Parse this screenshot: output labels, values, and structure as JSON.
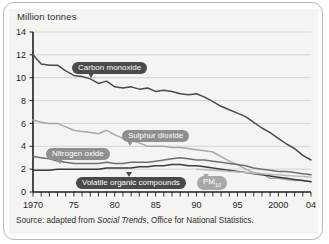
{
  "chart_data": {
    "type": "line",
    "title": "Million tonnes",
    "xlabel": "",
    "ylabel": "Million tonnes",
    "xlim": [
      1970,
      2004
    ],
    "ylim": [
      0,
      14
    ],
    "ytick_labels": [
      "0",
      "2",
      "4",
      "6",
      "8",
      "10",
      "12",
      "14"
    ],
    "ytick_values": [
      0,
      2,
      4,
      6,
      8,
      10,
      12,
      14
    ],
    "xtick_labels": [
      "1970",
      "75",
      "80",
      "85",
      "90",
      "95",
      "2000",
      "04"
    ],
    "xtick_values": [
      1970,
      1975,
      1980,
      1985,
      1990,
      1995,
      2000,
      2004
    ],
    "grid": true,
    "legend_position": "inline-callouts",
    "x": [
      1970,
      1971,
      1972,
      1973,
      1974,
      1975,
      1976,
      1977,
      1978,
      1979,
      1980,
      1981,
      1982,
      1983,
      1984,
      1985,
      1986,
      1987,
      1988,
      1989,
      1990,
      1991,
      1992,
      1993,
      1994,
      1995,
      1996,
      1997,
      1998,
      1999,
      2000,
      2001,
      2002,
      2003,
      2004
    ],
    "series": [
      {
        "name": "Carbon monoxide",
        "color": "#4a4a4a",
        "values": [
          12.0,
          11.2,
          11.1,
          11.1,
          10.6,
          10.2,
          10.1,
          9.9,
          9.5,
          9.7,
          9.2,
          9.1,
          9.2,
          9.0,
          9.1,
          8.8,
          8.9,
          8.8,
          8.6,
          8.5,
          8.6,
          8.3,
          7.9,
          7.5,
          7.2,
          6.9,
          6.6,
          6.1,
          5.6,
          5.2,
          4.7,
          4.2,
          3.8,
          3.2,
          2.8
        ]
      },
      {
        "name": "Sulphur dioxide",
        "color": "#a8a8a8",
        "values": [
          6.3,
          6.1,
          6.0,
          6.0,
          5.7,
          5.4,
          5.3,
          5.2,
          5.1,
          5.4,
          5.0,
          4.7,
          4.5,
          4.3,
          4.0,
          4.0,
          4.0,
          3.9,
          3.9,
          3.8,
          3.7,
          3.6,
          3.5,
          3.1,
          2.7,
          2.4,
          2.0,
          1.7,
          1.6,
          1.2,
          1.2,
          1.1,
          1.0,
          1.0,
          0.9
        ]
      },
      {
        "name": "Nitrogen oxide",
        "color": "#6f6f6f",
        "values": [
          3.1,
          3.0,
          2.9,
          2.7,
          2.6,
          2.5,
          2.5,
          2.5,
          2.5,
          2.6,
          2.5,
          2.5,
          2.6,
          2.6,
          2.6,
          2.7,
          2.8,
          2.9,
          3.0,
          2.9,
          2.8,
          2.8,
          2.7,
          2.6,
          2.5,
          2.4,
          2.3,
          2.1,
          2.0,
          1.9,
          1.8,
          1.8,
          1.7,
          1.6,
          1.5
        ]
      },
      {
        "name": "Volatile organic compounds",
        "color": "#3d3d3d",
        "values": [
          1.9,
          1.9,
          1.9,
          2.0,
          2.0,
          2.0,
          2.0,
          2.0,
          2.0,
          2.1,
          2.1,
          2.1,
          2.1,
          2.2,
          2.2,
          2.3,
          2.3,
          2.4,
          2.4,
          2.3,
          2.3,
          2.2,
          2.1,
          2.0,
          1.9,
          1.8,
          1.7,
          1.6,
          1.5,
          1.4,
          1.3,
          1.2,
          1.1,
          1.0,
          0.9
        ]
      },
      {
        "name": "PM10",
        "color": "#bdbdbd",
        "values": [
          null,
          null,
          null,
          null,
          null,
          null,
          null,
          null,
          null,
          null,
          null,
          null,
          null,
          null,
          null,
          null,
          null,
          null,
          null,
          null,
          2.0,
          1.95,
          1.9,
          1.85,
          1.8,
          1.75,
          1.7,
          1.65,
          1.6,
          1.55,
          1.5,
          1.45,
          1.4,
          1.35,
          1.3
        ]
      }
    ],
    "callouts": [
      {
        "label": "Carbon monoxide",
        "style": "dark"
      },
      {
        "label": "Sulphur dioxide",
        "style": "mid"
      },
      {
        "label": "Nitrogen oxide",
        "style": "mid"
      },
      {
        "label": "Volatile organic compounds",
        "style": "dark"
      },
      {
        "label": "PM",
        "sub": "10",
        "style": "light"
      }
    ]
  },
  "source": {
    "prefix": "Source: adapted from ",
    "publication": "Social Trends",
    "suffix": ", Office for National Statistics."
  }
}
